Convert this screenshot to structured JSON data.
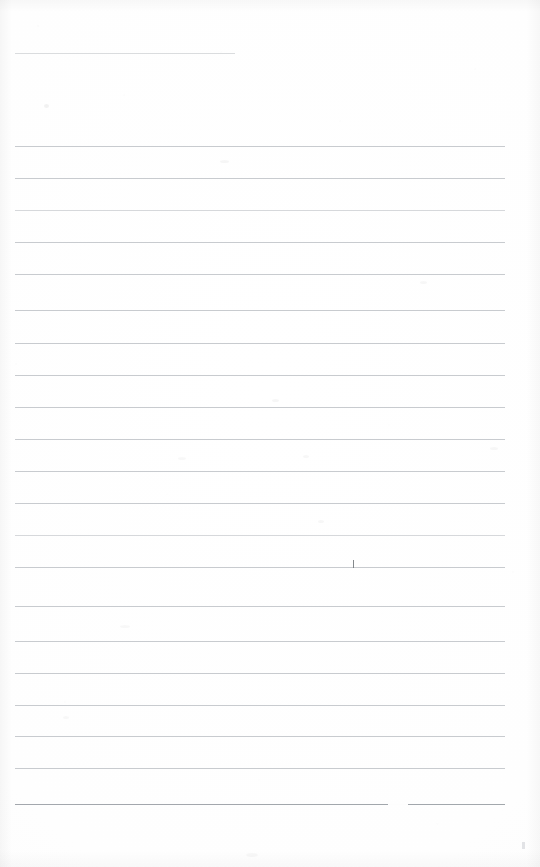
{
  "document": {
    "kind": "scanned-ruled-notebook-page",
    "title": "Blank Ruled Notebook Page",
    "written_text": "",
    "page_width": 540,
    "page_height": 867
  },
  "colors": {
    "paper": "#fefefe",
    "rule_line": "#b9bcc1",
    "rule_line_dark": "#9ba0a6",
    "rule_line_short": "#c3c6ca",
    "pen_mark": "#6f7478",
    "corner_mark": "#d8dadd"
  },
  "ruling": {
    "left_margin": 15,
    "right_margin": 505,
    "line_spacing": 32,
    "line_count": 22,
    "lines": [
      {
        "index": 1,
        "y": 53,
        "x1": 15,
        "x2": 235,
        "weight": "short"
      },
      {
        "index": 2,
        "y": 146,
        "x1": 15,
        "x2": 505,
        "weight": "normal"
      },
      {
        "index": 3,
        "y": 178,
        "x1": 15,
        "x2": 505,
        "weight": "normal"
      },
      {
        "index": 4,
        "y": 210,
        "x1": 15,
        "x2": 505,
        "weight": "light"
      },
      {
        "index": 5,
        "y": 242,
        "x1": 15,
        "x2": 505,
        "weight": "normal"
      },
      {
        "index": 6,
        "y": 274,
        "x1": 15,
        "x2": 505,
        "weight": "normal"
      },
      {
        "index": 7,
        "y": 310,
        "x1": 15,
        "x2": 505,
        "weight": "normal"
      },
      {
        "index": 8,
        "y": 343,
        "x1": 15,
        "x2": 505,
        "weight": "normal"
      },
      {
        "index": 9,
        "y": 375,
        "x1": 15,
        "x2": 505,
        "weight": "normal"
      },
      {
        "index": 10,
        "y": 407,
        "x1": 15,
        "x2": 505,
        "weight": "normal"
      },
      {
        "index": 11,
        "y": 439,
        "x1": 15,
        "x2": 505,
        "weight": "normal"
      },
      {
        "index": 12,
        "y": 471,
        "x1": 15,
        "x2": 505,
        "weight": "normal"
      },
      {
        "index": 13,
        "y": 503,
        "x1": 15,
        "x2": 505,
        "weight": "normal"
      },
      {
        "index": 14,
        "y": 535,
        "x1": 15,
        "x2": 505,
        "weight": "light"
      },
      {
        "index": 15,
        "y": 567,
        "x1": 15,
        "x2": 505,
        "weight": "normal"
      },
      {
        "index": 16,
        "y": 606,
        "x1": 15,
        "x2": 505,
        "weight": "normal"
      },
      {
        "index": 17,
        "y": 641,
        "x1": 15,
        "x2": 505,
        "weight": "normal"
      },
      {
        "index": 18,
        "y": 673,
        "x1": 15,
        "x2": 505,
        "weight": "normal"
      },
      {
        "index": 19,
        "y": 705,
        "x1": 15,
        "x2": 505,
        "weight": "normal"
      },
      {
        "index": 20,
        "y": 736,
        "x1": 15,
        "x2": 505,
        "weight": "normal"
      },
      {
        "index": 21,
        "y": 768,
        "x1": 15,
        "x2": 505,
        "weight": "normal"
      },
      {
        "index": 22,
        "y": 804,
        "x1": 15,
        "x2": 505,
        "weight": "dark",
        "gap_x1": 388,
        "gap_x2": 408
      }
    ]
  },
  "marks": {
    "pen_tick": {
      "x": 353,
      "y": 560,
      "height": 8
    },
    "corner_mark": {
      "x": 522,
      "y": 842
    },
    "smudges": [
      {
        "x": 44,
        "y": 104,
        "w": 5,
        "h": 4,
        "opacity": 0.05
      },
      {
        "x": 220,
        "y": 160,
        "w": 9,
        "h": 3,
        "opacity": 0.035
      },
      {
        "x": 272,
        "y": 399,
        "w": 7,
        "h": 3,
        "opacity": 0.035
      },
      {
        "x": 303,
        "y": 455,
        "w": 6,
        "h": 3,
        "opacity": 0.03
      },
      {
        "x": 178,
        "y": 457,
        "w": 8,
        "h": 3,
        "opacity": 0.028
      },
      {
        "x": 318,
        "y": 520,
        "w": 6,
        "h": 3,
        "opacity": 0.03
      },
      {
        "x": 120,
        "y": 625,
        "w": 10,
        "h": 3,
        "opacity": 0.026
      },
      {
        "x": 420,
        "y": 281,
        "w": 7,
        "h": 3,
        "opacity": 0.03
      },
      {
        "x": 490,
        "y": 447,
        "w": 8,
        "h": 3,
        "opacity": 0.03
      },
      {
        "x": 63,
        "y": 716,
        "w": 6,
        "h": 3,
        "opacity": 0.026
      },
      {
        "x": 246,
        "y": 853,
        "w": 12,
        "h": 4,
        "opacity": 0.026
      }
    ]
  }
}
